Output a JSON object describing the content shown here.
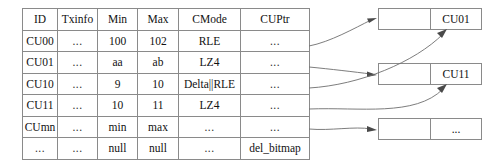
{
  "diagram": {
    "colors": {
      "border": "#8a8a8a",
      "arrow": "#6e6e6e",
      "arrowhead": "#4a4a4a",
      "background": "#ffffff",
      "text": "#111111"
    }
  },
  "table": {
    "name": "cu-metadata-table",
    "columns": [
      {
        "key": "id",
        "label": "ID"
      },
      {
        "key": "tx",
        "label": "Txinfo"
      },
      {
        "key": "min",
        "label": "Min"
      },
      {
        "key": "max",
        "label": "Max"
      },
      {
        "key": "cmode",
        "label": "CMode"
      },
      {
        "key": "cuptr",
        "label": "CUPtr"
      }
    ],
    "rows": [
      {
        "id": "CU00",
        "tx": "...",
        "min": "100",
        "max": "102",
        "cmode": "RLE",
        "cuptr": "..."
      },
      {
        "id": "CU01",
        "tx": "...",
        "min": "aa",
        "max": "ab",
        "cmode": "LZ4",
        "cuptr": "..."
      },
      {
        "id": "CU10",
        "tx": "...",
        "min": "9",
        "max": "10",
        "cmode": "Delta||RLE",
        "cuptr": "..."
      },
      {
        "id": "CU11",
        "tx": "...",
        "min": "10",
        "max": "11",
        "cmode": "LZ4",
        "cuptr": "..."
      },
      {
        "id": "CUmn",
        "tx": "...",
        "min": "min",
        "max": "max",
        "cmode": "...",
        "cuptr": "..."
      },
      {
        "id": "...",
        "tx": "...",
        "min": "null",
        "max": "null",
        "cmode": "...",
        "cuptr": "del_bitmap"
      }
    ]
  },
  "cu_boxes": [
    {
      "name": "cu-box-cu01",
      "left_label": "",
      "right_label": "CU01"
    },
    {
      "name": "cu-box-cu11",
      "left_label": "",
      "right_label": "CU11"
    },
    {
      "name": "cu-box-ellipsis",
      "left_label": "",
      "right_label": "..."
    }
  ]
}
